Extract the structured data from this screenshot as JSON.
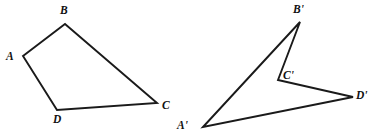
{
  "figure": {
    "background_color": "#ffffff",
    "stroke_color": "#1a1a1a",
    "stroke_width": 1.9,
    "label_color": "#111111",
    "canvas": {
      "width": 378,
      "height": 139
    },
    "shapes": [
      {
        "name": "quadrilateral-abcd",
        "closed": true,
        "path_points": "23,56 65,24 157,103 57,110",
        "vertices": [
          {
            "id": "A",
            "label": "A",
            "x": 23,
            "y": 56,
            "label_x": 6,
            "label_y": 51
          },
          {
            "id": "B",
            "label": "B",
            "x": 65,
            "y": 24,
            "label_x": 60,
            "label_y": 5
          },
          {
            "id": "C",
            "label": "C",
            "x": 157,
            "y": 103,
            "label_x": 162,
            "label_y": 100
          },
          {
            "id": "D",
            "label": "D",
            "x": 57,
            "y": 110,
            "label_x": 53,
            "label_y": 114
          }
        ]
      },
      {
        "name": "quadrilateral-a-prime-b-prime-c-prime-d-prime",
        "closed": true,
        "path_points": "203,127 300,22 278,80 353,97",
        "vertices": [
          {
            "id": "A-prime",
            "label": "A'",
            "x": 203,
            "y": 127,
            "label_x": 177,
            "label_y": 120
          },
          {
            "id": "B-prime",
            "label": "B'",
            "x": 300,
            "y": 22,
            "label_x": 293,
            "label_y": 4
          },
          {
            "id": "C-prime",
            "label": "C'",
            "x": 278,
            "y": 80,
            "label_x": 283,
            "label_y": 70
          },
          {
            "id": "D-prime",
            "label": "D'",
            "x": 353,
            "y": 97,
            "label_x": 356,
            "label_y": 90
          }
        ]
      }
    ]
  }
}
